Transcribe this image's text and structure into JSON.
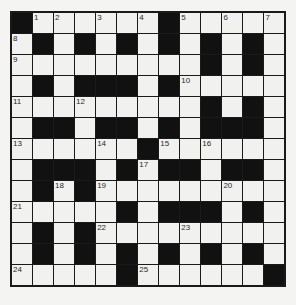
{
  "puzzle": {
    "size": 13,
    "colors": {
      "block": "#111111",
      "cell": "#f1f1ef",
      "grid_line": "#1a1a1a",
      "background": "#f4f4f2"
    },
    "rows": [
      [
        "#",
        "1",
        "2",
        ".",
        "3",
        ".",
        "4",
        "#",
        "5",
        ".",
        "6",
        ".",
        "7"
      ],
      [
        "8",
        "#",
        ".",
        "#",
        ".",
        "#",
        ".",
        "#",
        ".",
        "#",
        ".",
        "#",
        "."
      ],
      [
        "9",
        ".",
        ".",
        ".",
        ".",
        ".",
        ".",
        ".",
        ".",
        "#",
        ".",
        "#",
        "."
      ],
      [
        ".",
        "#",
        ".",
        "#",
        "#",
        "#",
        ".",
        "#",
        "10",
        ".",
        ".",
        ".",
        "."
      ],
      [
        "11",
        ".",
        ".",
        "12",
        ".",
        ".",
        ".",
        ".",
        ".",
        "#",
        ".",
        "#",
        "."
      ],
      [
        ".",
        "#",
        "#",
        ".",
        "#",
        "#",
        ".",
        "#",
        ".",
        "#",
        "#",
        "#",
        "."
      ],
      [
        "13",
        ".",
        ".",
        ".",
        "14",
        ".",
        "#",
        "15",
        ".",
        "16",
        ".",
        ".",
        "."
      ],
      [
        ".",
        "#",
        "#",
        "#",
        ".",
        "#",
        "17",
        "#",
        "#",
        ".",
        "#",
        "#",
        "."
      ],
      [
        ".",
        "#",
        "18",
        "#",
        "19",
        ".",
        ".",
        ".",
        ".",
        ".",
        "20",
        ".",
        "."
      ],
      [
        "21",
        ".",
        ".",
        ".",
        ".",
        "#",
        ".",
        "#",
        "#",
        "#",
        ".",
        "#",
        "."
      ],
      [
        ".",
        "#",
        ".",
        "#",
        "22",
        ".",
        ".",
        ".",
        "23",
        ".",
        ".",
        ".",
        "."
      ],
      [
        ".",
        "#",
        ".",
        "#",
        ".",
        "#",
        ".",
        "#",
        ".",
        "#",
        ".",
        "#",
        "."
      ],
      [
        "24",
        ".",
        ".",
        ".",
        ".",
        "#",
        "25",
        ".",
        ".",
        ".",
        ".",
        ".",
        "#"
      ]
    ],
    "clue_numbers": [
      "1",
      "2",
      "3",
      "4",
      "5",
      "6",
      "7",
      "8",
      "9",
      "10",
      "11",
      "12",
      "13",
      "14",
      "15",
      "16",
      "17",
      "18",
      "19",
      "20",
      "21",
      "22",
      "23",
      "24",
      "25"
    ]
  }
}
